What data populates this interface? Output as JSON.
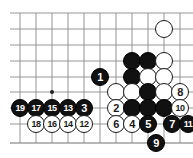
{
  "figure": {
    "kind": "go-board-diagram",
    "width": 193,
    "height": 158,
    "background_color": "#ffffff"
  },
  "board": {
    "line_color": "#8a8a8a",
    "edge_line_color": "#6f6f6f",
    "x_lines": [
      20,
      36,
      52,
      68,
      84,
      100,
      116,
      132,
      148,
      164,
      180
    ],
    "y_lines": [
      13,
      29,
      45,
      61,
      77,
      92,
      108,
      124,
      143
    ],
    "star_points": [
      {
        "x": 52,
        "y": 92
      }
    ],
    "stone_radius": 9
  },
  "colors": {
    "black_stone": "#111111",
    "white_stone": "#ffffff",
    "stone_outline": "#1a1a1a",
    "label_on_black": "#ffffff",
    "label_on_white": "#1a1a1a"
  },
  "stones": [
    {
      "id": "w-upper-right",
      "color": "white",
      "x": 164,
      "y": 29,
      "label": ""
    },
    {
      "id": "b-r3c8",
      "color": "black",
      "x": 132,
      "y": 61,
      "label": ""
    },
    {
      "id": "b-r3c9",
      "color": "black",
      "x": 148,
      "y": 61,
      "label": ""
    },
    {
      "id": "w-r3c10",
      "color": "white",
      "x": 164,
      "y": 61,
      "label": ""
    },
    {
      "id": "b-move-1",
      "color": "black",
      "x": 100,
      "y": 77,
      "label": "1"
    },
    {
      "id": "b-r4c8",
      "color": "black",
      "x": 132,
      "y": 77,
      "label": ""
    },
    {
      "id": "w-r4c9",
      "color": "white",
      "x": 148,
      "y": 77,
      "label": ""
    },
    {
      "id": "w-r4c10",
      "color": "white",
      "x": 164,
      "y": 77,
      "label": ""
    },
    {
      "id": "w-r5c7",
      "color": "white",
      "x": 116,
      "y": 92,
      "label": ""
    },
    {
      "id": "w-r5c8",
      "color": "white",
      "x": 132,
      "y": 92,
      "label": ""
    },
    {
      "id": "b-r5c9",
      "color": "black",
      "x": 148,
      "y": 92,
      "label": ""
    },
    {
      "id": "w-r5c10",
      "color": "white",
      "x": 164,
      "y": 92,
      "label": ""
    },
    {
      "id": "w-move-8",
      "color": "white",
      "x": 180,
      "y": 92,
      "label": "8"
    },
    {
      "id": "b-move-19",
      "color": "black",
      "x": 20,
      "y": 108,
      "label": "19"
    },
    {
      "id": "b-move-17",
      "color": "black",
      "x": 36,
      "y": 108,
      "label": "17"
    },
    {
      "id": "b-move-15",
      "color": "black",
      "x": 52,
      "y": 108,
      "label": "15"
    },
    {
      "id": "b-move-13",
      "color": "black",
      "x": 68,
      "y": 108,
      "label": "13"
    },
    {
      "id": "b-move-3",
      "color": "black",
      "x": 84,
      "y": 108,
      "label": "3"
    },
    {
      "id": "w-move-2",
      "color": "white",
      "x": 116,
      "y": 108,
      "label": "2"
    },
    {
      "id": "b-r6c8",
      "color": "black",
      "x": 132,
      "y": 108,
      "label": ""
    },
    {
      "id": "b-r6c9",
      "color": "black",
      "x": 148,
      "y": 108,
      "label": ""
    },
    {
      "id": "b-r6c10",
      "color": "black",
      "x": 164,
      "y": 108,
      "label": ""
    },
    {
      "id": "w-move-10",
      "color": "white",
      "x": 180,
      "y": 108,
      "label": "10"
    },
    {
      "id": "w-move-18",
      "color": "white",
      "x": 36,
      "y": 124,
      "label": "18"
    },
    {
      "id": "w-move-16",
      "color": "white",
      "x": 52,
      "y": 124,
      "label": "16"
    },
    {
      "id": "w-move-14",
      "color": "white",
      "x": 68,
      "y": 124,
      "label": "14"
    },
    {
      "id": "w-move-12",
      "color": "white",
      "x": 84,
      "y": 124,
      "label": "12"
    },
    {
      "id": "w-move-6",
      "color": "white",
      "x": 116,
      "y": 124,
      "label": "6"
    },
    {
      "id": "w-move-4",
      "color": "white",
      "x": 132,
      "y": 124,
      "label": "4"
    },
    {
      "id": "b-move-5",
      "color": "black",
      "x": 148,
      "y": 124,
      "label": "5"
    },
    {
      "id": "b-move-7",
      "color": "black",
      "x": 172,
      "y": 124,
      "label": "7"
    },
    {
      "id": "b-move-11",
      "color": "black",
      "x": 188,
      "y": 124,
      "label": "11"
    },
    {
      "id": "b-move-9",
      "color": "black",
      "x": 156,
      "y": 143,
      "label": "9"
    }
  ]
}
